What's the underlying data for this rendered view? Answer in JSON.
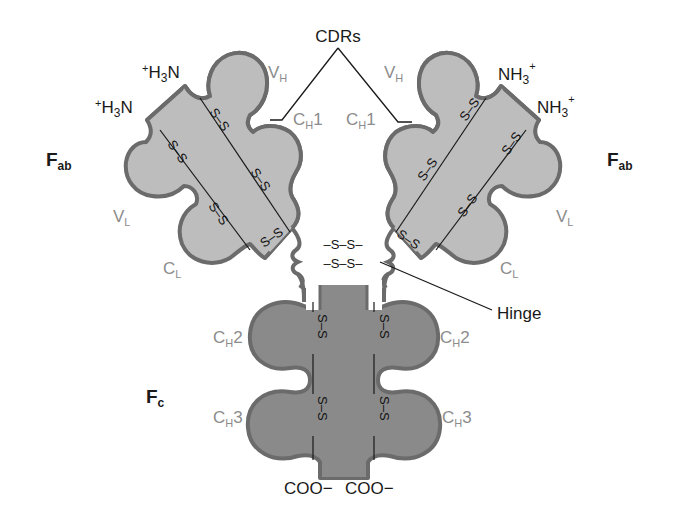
{
  "diagram": {
    "colors": {
      "fab_fill": "#bdbdbd",
      "fc_fill": "#8a8a8a",
      "outline": "#6b6b6b",
      "label_grey": "#8c8c8c",
      "label_dark": "#1a1a1a"
    },
    "labels": {
      "cdrs": "CDRs",
      "fab_left": {
        "main": "F",
        "sub": "ab"
      },
      "fab_right": {
        "main": "F",
        "sub": "ab"
      },
      "fc": {
        "main": "F",
        "sub": "c"
      },
      "hinge": "Hinge",
      "n_term_left_heavy": {
        "sup": "+",
        "main": "H",
        "sub": "3",
        "end": "N"
      },
      "n_term_left_light": {
        "sup": "+",
        "main": "H",
        "sub": "3",
        "end": "N"
      },
      "n_term_right_heavy": {
        "main": "NH",
        "sub": "3",
        "sup": "+"
      },
      "n_term_right_light": {
        "main": "NH",
        "sub": "3",
        "sup": "+"
      },
      "c_term_left": "COO−",
      "c_term_right": "COO−",
      "domains": {
        "vh_left": {
          "main": "V",
          "sub": "H"
        },
        "vh_right": {
          "main": "V",
          "sub": "H"
        },
        "ch1_left": {
          "main": "C",
          "sub": "H",
          "end": "1"
        },
        "ch1_right": {
          "main": "C",
          "sub": "H",
          "end": "1"
        },
        "vl_left": {
          "main": "V",
          "sub": "L"
        },
        "vl_right": {
          "main": "V",
          "sub": "L"
        },
        "cl_left": {
          "main": "C",
          "sub": "L"
        },
        "cl_right": {
          "main": "C",
          "sub": "L"
        },
        "ch2_left": {
          "main": "C",
          "sub": "H",
          "end": "2"
        },
        "ch2_right": {
          "main": "C",
          "sub": "H",
          "end": "2"
        },
        "ch3_left": {
          "main": "C",
          "sub": "H",
          "end": "3"
        },
        "ch3_right": {
          "main": "C",
          "sub": "H",
          "end": "3"
        }
      },
      "disulfide": "S–S",
      "hinge_bond": "–S–S–"
    }
  }
}
